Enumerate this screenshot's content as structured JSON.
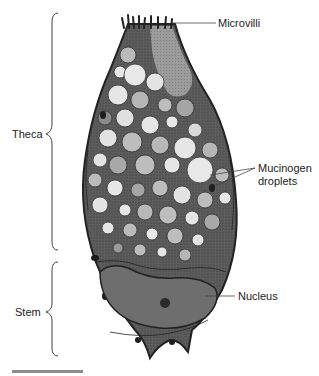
{
  "diagram": {
    "labels": {
      "microvilli": "Microvilli",
      "mucinogen_line1": "Mucinogen",
      "mucinogen_line2": "droplets",
      "nucleus": "Nucleus",
      "theca": "Theca",
      "stem": "Stem"
    },
    "regions": [
      {
        "name": "Theca",
        "bracket_top": 13,
        "bracket_bottom": 250
      },
      {
        "name": "Stem",
        "bracket_top": 262,
        "bracket_bottom": 356
      }
    ],
    "scale_bar": {
      "visible": true,
      "label": ""
    },
    "colors": {
      "outline": "#2a2a2a",
      "cytoplasm": "#5a5a5a",
      "droplet_light": "#e6e6e6",
      "droplet_mid": "#b9b9b9",
      "droplet_dark": "#8a8a8a",
      "nucleus": "#6e6e6e",
      "label_text": "#222222",
      "leader_line": "#444444",
      "scale_bar": "#8c8c8c"
    }
  }
}
